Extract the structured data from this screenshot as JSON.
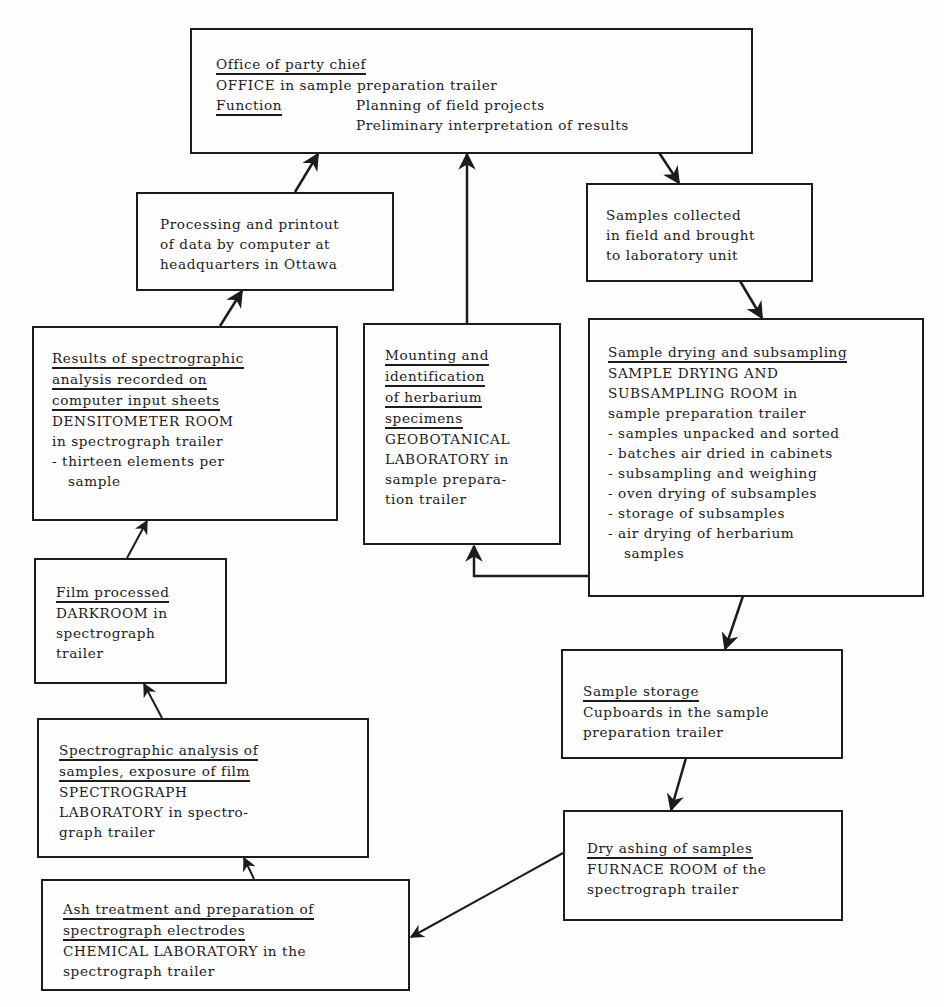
{
  "diagram": {
    "boxes": {
      "office": {
        "heading": "Office of party chief",
        "location": "OFFICE in sample preparation trailer",
        "function_label": "Function",
        "functions": [
          "Planning of field projects",
          "Preliminary interpretation of results"
        ]
      },
      "processing": {
        "lines": [
          "Processing and printout",
          "of data by computer at",
          "headquarters in Ottawa"
        ]
      },
      "samples_collected": {
        "lines": [
          "Samples collected",
          "in field and brought",
          "to laboratory unit"
        ]
      },
      "results": {
        "heading_lines": [
          "Results of spectrographic",
          "analysis recorded on",
          "computer input sheets"
        ],
        "location_lines": [
          "DENSITOMETER ROOM",
          "in spectrograph trailer"
        ],
        "bullets": [
          "- thirteen elements per sample"
        ]
      },
      "mounting": {
        "heading_lines": [
          "Mounting and",
          "identification",
          "of herbarium",
          "specimens"
        ],
        "location_lines": [
          "GEOBOTANICAL",
          "LABORATORY in",
          "sample prepara-",
          "tion trailer"
        ]
      },
      "sample_drying": {
        "heading": "Sample drying and subsampling",
        "location_lines": [
          "SAMPLE DRYING AND",
          "SUBSAMPLING ROOM in",
          "sample preparation trailer"
        ],
        "bullets": [
          "- samples unpacked and sorted",
          "- batches air dried in cabinets",
          "- subsampling and weighing",
          "- oven drying of subsamples",
          "- storage of subsamples",
          "- air drying of herbarium samples"
        ]
      },
      "film": {
        "heading": "Film processed",
        "location_lines": [
          "DARKROOM in",
          "spectrograph",
          "trailer"
        ]
      },
      "spectrographic": {
        "heading_lines": [
          "Spectrographic analysis of",
          "samples, exposure of film"
        ],
        "location_lines": [
          "SPECTROGRAPH",
          "LABORATORY in spectro-",
          "graph trailer"
        ]
      },
      "sample_storage": {
        "heading": "Sample storage",
        "location_lines": [
          "Cupboards in the sample",
          "preparation trailer"
        ]
      },
      "dry_ashing": {
        "heading": "Dry ashing of samples",
        "location_lines": [
          "FURNACE ROOM of the",
          "spectrograph trailer"
        ]
      },
      "ash_treatment": {
        "heading_lines": [
          "Ash treatment and preparation of",
          "spectrograph electrodes"
        ],
        "location_lines": [
          "CHEMICAL LABORATORY in the",
          "spectrograph trailer"
        ]
      }
    },
    "flow": [
      {
        "from": "office",
        "to": "samples_collected"
      },
      {
        "from": "samples_collected",
        "to": "sample_drying"
      },
      {
        "from": "sample_drying",
        "to": "mounting"
      },
      {
        "from": "mounting",
        "to": "office"
      },
      {
        "from": "sample_drying",
        "to": "sample_storage"
      },
      {
        "from": "sample_storage",
        "to": "dry_ashing"
      },
      {
        "from": "dry_ashing",
        "to": "ash_treatment"
      },
      {
        "from": "ash_treatment",
        "to": "spectrographic"
      },
      {
        "from": "spectrographic",
        "to": "film"
      },
      {
        "from": "film",
        "to": "results"
      },
      {
        "from": "results",
        "to": "processing"
      },
      {
        "from": "processing",
        "to": "office"
      }
    ],
    "colors": {
      "ink": "#1c1c1c",
      "paper": "#fdfdfd"
    }
  }
}
